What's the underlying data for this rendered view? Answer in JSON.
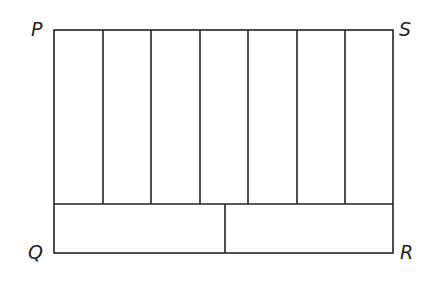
{
  "diagram": {
    "type": "partitioned-rectangle",
    "vertices": {
      "top_left": "P",
      "top_right": "S",
      "bottom_left": "Q",
      "bottom_right": "R"
    },
    "upper_strips": 7,
    "lower_rectangles": 2,
    "stroke_color": "#222222",
    "background": "#ffffff"
  },
  "labels": {
    "P": "P",
    "S": "S",
    "Q": "Q",
    "R": "R"
  }
}
